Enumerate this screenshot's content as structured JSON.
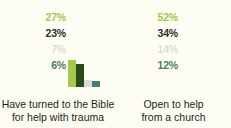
{
  "chart_data": {
    "type": "bar",
    "title": "",
    "xlabel": "",
    "ylabel": "",
    "ylim": [
      0,
      60
    ],
    "grid": false,
    "legend": "none",
    "orientation": "vertical",
    "grouped": true,
    "categories": [
      "Have turned to the Bible for help with trauma",
      "Open to help from a church"
    ],
    "series": [
      {
        "name": "series-1",
        "color": "#a3c84b",
        "values": [
          27,
          52
        ],
        "labels": [
          "27%",
          "52%"
        ]
      },
      {
        "name": "series-2",
        "color": "#2b4a17",
        "values": [
          23,
          34
        ],
        "labels": [
          "23%",
          "34%"
        ]
      },
      {
        "name": "series-3",
        "color": "#d9ded4",
        "values": [
          7,
          14
        ],
        "labels": [
          "7%",
          "14%"
        ]
      },
      {
        "name": "series-4",
        "color": "#4b7d6b",
        "values": [
          6,
          12
        ],
        "labels": [
          "6%",
          "12%"
        ]
      }
    ]
  },
  "groups": [
    {
      "caption_line1": "Have turned to the Bible",
      "caption_line2": "for help with trauma",
      "labels": [
        "27%",
        "23%",
        "7%",
        "6%"
      ],
      "values": [
        27,
        23,
        7,
        6
      ]
    },
    {
      "caption_line1": "Open to help",
      "caption_line2": "from a church",
      "labels": [
        "52%",
        "34%",
        "14%",
        "12%"
      ],
      "values": [
        52,
        34,
        14,
        12
      ]
    }
  ],
  "colors": {
    "background": "#fefdf3",
    "series_1": "#a3c84b",
    "series_2": "#2b4a17",
    "series_3": "#d9ded4",
    "series_4": "#4b7d6b",
    "label_dark": "#2d2d2d",
    "caption": "#1d1d1d"
  }
}
